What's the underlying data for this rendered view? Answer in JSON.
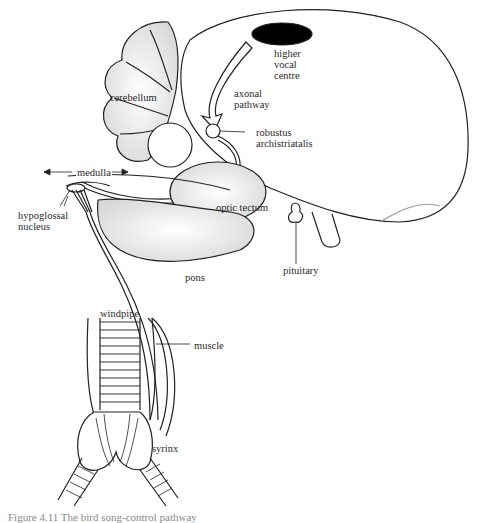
{
  "figure": {
    "caption_partial": "Figure 4.11  The bird song-control pathway",
    "labels": {
      "hvc": [
        "higher",
        "vocal",
        "centre"
      ],
      "axonal": [
        "axonal",
        "pathway"
      ],
      "cerebellum": "cerebellum",
      "ra": [
        "robustus",
        "archistriatalis"
      ],
      "medulla": "medulla",
      "hypoglossal": [
        "hypoglossal",
        "nucleus"
      ],
      "optic_tectum": "optic tectum",
      "pons": "pons",
      "pituitary": "pituitary",
      "windpipe": "windpipe",
      "muscle": "muscle",
      "syrinx": "syrinx"
    },
    "colors": {
      "ink": "#222222",
      "background": "#ffffff",
      "hvc_fill": "#000000",
      "shading": "#cccccc"
    }
  }
}
